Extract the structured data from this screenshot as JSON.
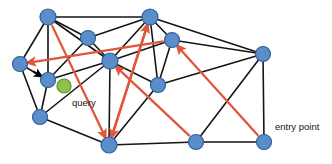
{
  "figure": {
    "title": "",
    "width": 332,
    "height": 164,
    "background": "#ffffff"
  },
  "colors": {
    "node_fill": "#5b8dc8",
    "node_stroke": "#2f5f9e",
    "query_fill": "#8bc34a",
    "query_stroke": "#5b8f1f",
    "edge": "#151515",
    "search_path": "#e1553a",
    "black_arrow": "#000000",
    "label_text": "#161616"
  },
  "labels": [
    {
      "id": "query-label",
      "text": "query",
      "x": 72,
      "y": 103,
      "anchor": "start"
    },
    {
      "id": "entry-point-label",
      "text": "entry point",
      "x": 275,
      "y": 127,
      "anchor": "start"
    }
  ],
  "chart_data": {
    "type": "diagram",
    "subtype": "hnsw-greedy-search-graph",
    "title": "",
    "xlabel": "",
    "ylabel": "",
    "xlim": [
      0,
      332
    ],
    "ylim": [
      0,
      164
    ],
    "grid": false,
    "legend": null,
    "nodes": [
      {
        "id": "n0",
        "label": "",
        "x": 48,
        "y": 17,
        "r": 8.0,
        "kind": "graph-node"
      },
      {
        "id": "n1",
        "label": "",
        "x": 150,
        "y": 17,
        "r": 8.0,
        "kind": "graph-node"
      },
      {
        "id": "n2",
        "label": "",
        "x": 88,
        "y": 38,
        "r": 7.5,
        "kind": "graph-node"
      },
      {
        "id": "n3",
        "label": "",
        "x": 172,
        "y": 40,
        "r": 7.5,
        "kind": "graph-node"
      },
      {
        "id": "n4",
        "label": "",
        "x": 263,
        "y": 54,
        "r": 7.5,
        "kind": "graph-node"
      },
      {
        "id": "n5",
        "label": "",
        "x": 20,
        "y": 64,
        "r": 7.5,
        "kind": "graph-node"
      },
      {
        "id": "n6",
        "label": "",
        "x": 110,
        "y": 61,
        "r": 8.0,
        "kind": "graph-node"
      },
      {
        "id": "n7",
        "label": "",
        "x": 48,
        "y": 80,
        "r": 7.5,
        "kind": "graph-node"
      },
      {
        "id": "n8",
        "label": "",
        "x": 158,
        "y": 85,
        "r": 7.5,
        "kind": "graph-node"
      },
      {
        "id": "n9",
        "label": "",
        "x": 40,
        "y": 117,
        "r": 7.5,
        "kind": "graph-node"
      },
      {
        "id": "n10",
        "label": "",
        "x": 109,
        "y": 145,
        "r": 8.0,
        "kind": "graph-node"
      },
      {
        "id": "n11",
        "label": "",
        "x": 196,
        "y": 142,
        "r": 7.5,
        "kind": "graph-node"
      },
      {
        "id": "n12",
        "label": "entry point",
        "x": 264,
        "y": 142,
        "r": 7.5,
        "kind": "entry-point-node"
      }
    ],
    "query_point": {
      "id": "q",
      "label": "query",
      "x": 64,
      "y": 86,
      "r": 7.0,
      "kind": "query-node"
    },
    "edges": [
      {
        "from": "n0",
        "to": "n1"
      },
      {
        "from": "n0",
        "to": "n2"
      },
      {
        "from": "n0",
        "to": "n5"
      },
      {
        "from": "n0",
        "to": "n6"
      },
      {
        "from": "n0",
        "to": "n7"
      },
      {
        "from": "n1",
        "to": "n2"
      },
      {
        "from": "n1",
        "to": "n3"
      },
      {
        "from": "n1",
        "to": "n6"
      },
      {
        "from": "n1",
        "to": "n8"
      },
      {
        "from": "n1",
        "to": "n4"
      },
      {
        "from": "n2",
        "to": "n6"
      },
      {
        "from": "n2",
        "to": "n7"
      },
      {
        "from": "n3",
        "to": "n4"
      },
      {
        "from": "n3",
        "to": "n6"
      },
      {
        "from": "n3",
        "to": "n8"
      },
      {
        "from": "n4",
        "to": "n8"
      },
      {
        "from": "n4",
        "to": "n11"
      },
      {
        "from": "n4",
        "to": "n12"
      },
      {
        "from": "n5",
        "to": "n7"
      },
      {
        "from": "n5",
        "to": "n9"
      },
      {
        "from": "n6",
        "to": "n7"
      },
      {
        "from": "n6",
        "to": "n8"
      },
      {
        "from": "n6",
        "to": "n9"
      },
      {
        "from": "n6",
        "to": "n10"
      },
      {
        "from": "n7",
        "to": "n9"
      },
      {
        "from": "n8",
        "to": "n10"
      },
      {
        "from": "n9",
        "to": "n10"
      },
      {
        "from": "n10",
        "to": "n11"
      },
      {
        "from": "n11",
        "to": "n12"
      }
    ],
    "search_path_arrows": [
      {
        "id": "hop-1",
        "from": "n12",
        "to": "n3",
        "color": "#e1553a",
        "note": "entry point to upper-middle node"
      },
      {
        "id": "hop-2",
        "from": "n1",
        "to": "n10",
        "color": "#e1553a",
        "note": "top node down to bottom hub"
      },
      {
        "id": "hop-3",
        "from": "n10",
        "to": "n1",
        "color": "#e1553a",
        "note": "bottom hub back toward top"
      },
      {
        "id": "hop-4",
        "from": "n11",
        "to": "n6",
        "color": "#e1553a",
        "note": "lower-right node to center hub"
      },
      {
        "id": "hop-5",
        "from": "n0",
        "to": "n10",
        "color": "#e1553a",
        "note": "top-left down to bottom hub"
      },
      {
        "id": "hop-6",
        "from": "n3",
        "to": "n5",
        "color": "#e1553a",
        "note": "long hop left to leftmost node"
      }
    ],
    "final_arrow": {
      "id": "final-hop",
      "from": "n5",
      "to": "n7",
      "color": "#000000",
      "note": "final black arrow landing on nearest neighbour of query"
    }
  }
}
